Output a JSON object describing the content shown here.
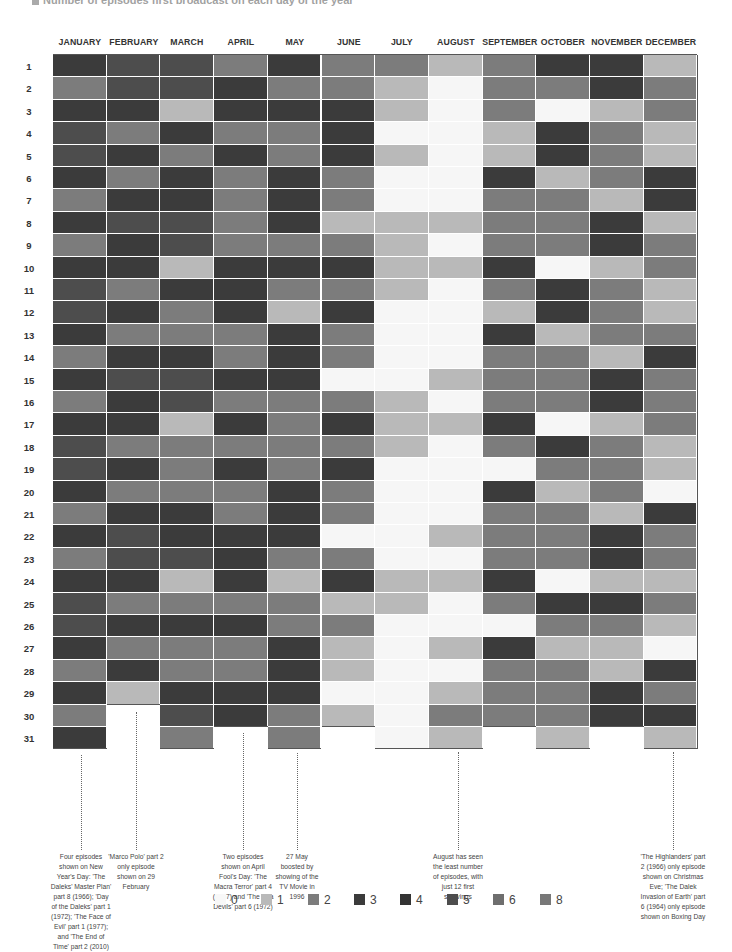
{
  "title": "Number of episodes first broadcast on each day of the year",
  "months": [
    "JANUARY",
    "FEBRUARY",
    "MARCH",
    "APRIL",
    "MAY",
    "JUNE",
    "JULY",
    "AUGUST",
    "SEPTEMBER",
    "OCTOBER",
    "NOVEMBER",
    "DECEMBER"
  ],
  "days": [
    "1",
    "2",
    "3",
    "4",
    "5",
    "6",
    "7",
    "8",
    "9",
    "10",
    "11",
    "12",
    "13",
    "14",
    "15",
    "16",
    "17",
    "18",
    "19",
    "20",
    "21",
    "22",
    "23",
    "24",
    "25",
    "26",
    "27",
    "28",
    "29",
    "30",
    "31"
  ],
  "colors": {
    "0": "#f6f6f6",
    "1": "#b9b9b9",
    "2": "#7c7c7c",
    "3": "#3b3b3b",
    "4": "#333333",
    "5": "#4d4d4d",
    "6": "#6e6e6e",
    "8": "#787878"
  },
  "legend": [
    {
      "label": "0",
      "key": "0"
    },
    {
      "label": "1",
      "key": "1"
    },
    {
      "label": "2",
      "key": "2"
    },
    {
      "label": "3",
      "key": "3"
    },
    {
      "label": "4",
      "key": "4"
    },
    {
      "label": "5",
      "key": "5"
    },
    {
      "label": "6",
      "key": "6"
    },
    {
      "label": "8",
      "key": "8"
    }
  ],
  "annotations": [
    {
      "id": "jan",
      "text": "Four episodes shown on New Year's Day: 'The Daleks' Master Plan' part 8 (1966); 'Day of the Daleks' part 1 (1972); 'The Face of Evil' part 1 (1977); and 'The End of Time' part 2 (2010)"
    },
    {
      "id": "feb",
      "text": "'Marco Polo' part 2 only episode shown on 29 February"
    },
    {
      "id": "apr",
      "text": "Two episodes shown on April Fool's Day: 'The Macra Terror' part 4 (1967) and 'The Sea Devils' part 6 (1972)"
    },
    {
      "id": "may",
      "text": "27 May boosted by showing of the TV Movie in 1996"
    },
    {
      "id": "aug",
      "text": "August has seen the least number of episodes, with just 12 first showings"
    },
    {
      "id": "dec",
      "text": "'The Highlanders' part 2 (1966) only episode shown on Christmas Eve; 'The Dalek Invasion of Earth' part 6 (1964) only episode shown on Boxing Day"
    }
  ],
  "chart_data": {
    "type": "heatmap",
    "title": "Number of episodes first broadcast on each day of the year",
    "x": [
      "JANUARY",
      "FEBRUARY",
      "MARCH",
      "APRIL",
      "MAY",
      "JUNE",
      "JULY",
      "AUGUST",
      "SEPTEMBER",
      "OCTOBER",
      "NOVEMBER",
      "DECEMBER"
    ],
    "y": [
      1,
      2,
      3,
      4,
      5,
      6,
      7,
      8,
      9,
      10,
      11,
      12,
      13,
      14,
      15,
      16,
      17,
      18,
      19,
      20,
      21,
      22,
      23,
      24,
      25,
      26,
      27,
      28,
      29,
      30,
      31
    ],
    "legend_values": [
      0,
      1,
      2,
      3,
      4,
      5,
      6,
      8
    ],
    "note": "Values are shade classes estimated from grayscale (0=none, 1=light, 2=mid, 3=dark, 5=medium-dark); null = day does not exist",
    "values": {
      "JANUARY": [
        3,
        2,
        3,
        5,
        5,
        3,
        2,
        3,
        2,
        3,
        5,
        5,
        3,
        2,
        3,
        2,
        3,
        5,
        5,
        3,
        2,
        3,
        2,
        3,
        5,
        5,
        3,
        2,
        3,
        2,
        3
      ],
      "FEBRUARY": [
        5,
        5,
        3,
        2,
        3,
        2,
        3,
        5,
        3,
        3,
        2,
        3,
        2,
        3,
        5,
        3,
        3,
        2,
        3,
        2,
        3,
        5,
        5,
        3,
        2,
        3,
        2,
        3,
        1,
        null,
        null
      ],
      "MARCH": [
        5,
        5,
        1,
        3,
        2,
        3,
        3,
        5,
        5,
        1,
        3,
        2,
        2,
        3,
        5,
        5,
        1,
        2,
        2,
        2,
        3,
        3,
        5,
        1,
        2,
        3,
        2,
        2,
        3,
        5,
        2
      ],
      "APRIL": [
        2,
        3,
        3,
        2,
        3,
        2,
        2,
        2,
        2,
        3,
        3,
        3,
        2,
        2,
        3,
        2,
        3,
        2,
        3,
        2,
        2,
        3,
        3,
        3,
        2,
        3,
        2,
        2,
        3,
        3,
        null
      ],
      "MAY": [
        3,
        2,
        3,
        2,
        2,
        3,
        3,
        3,
        2,
        3,
        2,
        1,
        3,
        3,
        3,
        2,
        2,
        2,
        2,
        3,
        3,
        3,
        2,
        1,
        2,
        2,
        3,
        3,
        3,
        2,
        2
      ],
      "JUNE": [
        2,
        2,
        3,
        3,
        3,
        2,
        2,
        1,
        2,
        3,
        2,
        3,
        2,
        2,
        0,
        2,
        3,
        2,
        3,
        2,
        2,
        0,
        2,
        3,
        1,
        2,
        1,
        1,
        0,
        1,
        null
      ],
      "JULY": [
        2,
        1,
        1,
        0,
        1,
        0,
        0,
        1,
        1,
        1,
        1,
        0,
        0,
        0,
        0,
        1,
        1,
        1,
        0,
        0,
        0,
        0,
        0,
        1,
        1,
        0,
        0,
        0,
        0,
        0,
        0
      ],
      "AUGUST": [
        1,
        0,
        0,
        0,
        0,
        0,
        0,
        1,
        0,
        1,
        0,
        0,
        0,
        0,
        1,
        0,
        1,
        0,
        0,
        0,
        0,
        1,
        0,
        1,
        0,
        0,
        1,
        0,
        1,
        2,
        1
      ],
      "SEPTEMBER": [
        2,
        2,
        2,
        1,
        1,
        3,
        2,
        2,
        2,
        3,
        2,
        1,
        3,
        2,
        2,
        2,
        3,
        2,
        0,
        3,
        2,
        2,
        2,
        3,
        2,
        0,
        3,
        2,
        2,
        2,
        null
      ],
      "OCTOBER": [
        3,
        2,
        0,
        3,
        3,
        1,
        2,
        2,
        2,
        0,
        3,
        3,
        1,
        2,
        2,
        2,
        0,
        3,
        2,
        1,
        2,
        2,
        2,
        0,
        3,
        2,
        1,
        2,
        2,
        2,
        1
      ],
      "NOVEMBER": [
        3,
        3,
        1,
        2,
        2,
        2,
        1,
        3,
        3,
        1,
        2,
        2,
        2,
        1,
        3,
        3,
        1,
        2,
        2,
        2,
        1,
        3,
        3,
        1,
        3,
        2,
        1,
        1,
        3,
        3,
        null
      ],
      "DECEMBER": [
        1,
        2,
        2,
        1,
        1,
        3,
        3,
        1,
        2,
        2,
        1,
        1,
        2,
        3,
        2,
        2,
        2,
        1,
        1,
        0,
        3,
        2,
        2,
        1,
        2,
        1,
        0,
        3,
        2,
        3,
        1
      ]
    }
  }
}
